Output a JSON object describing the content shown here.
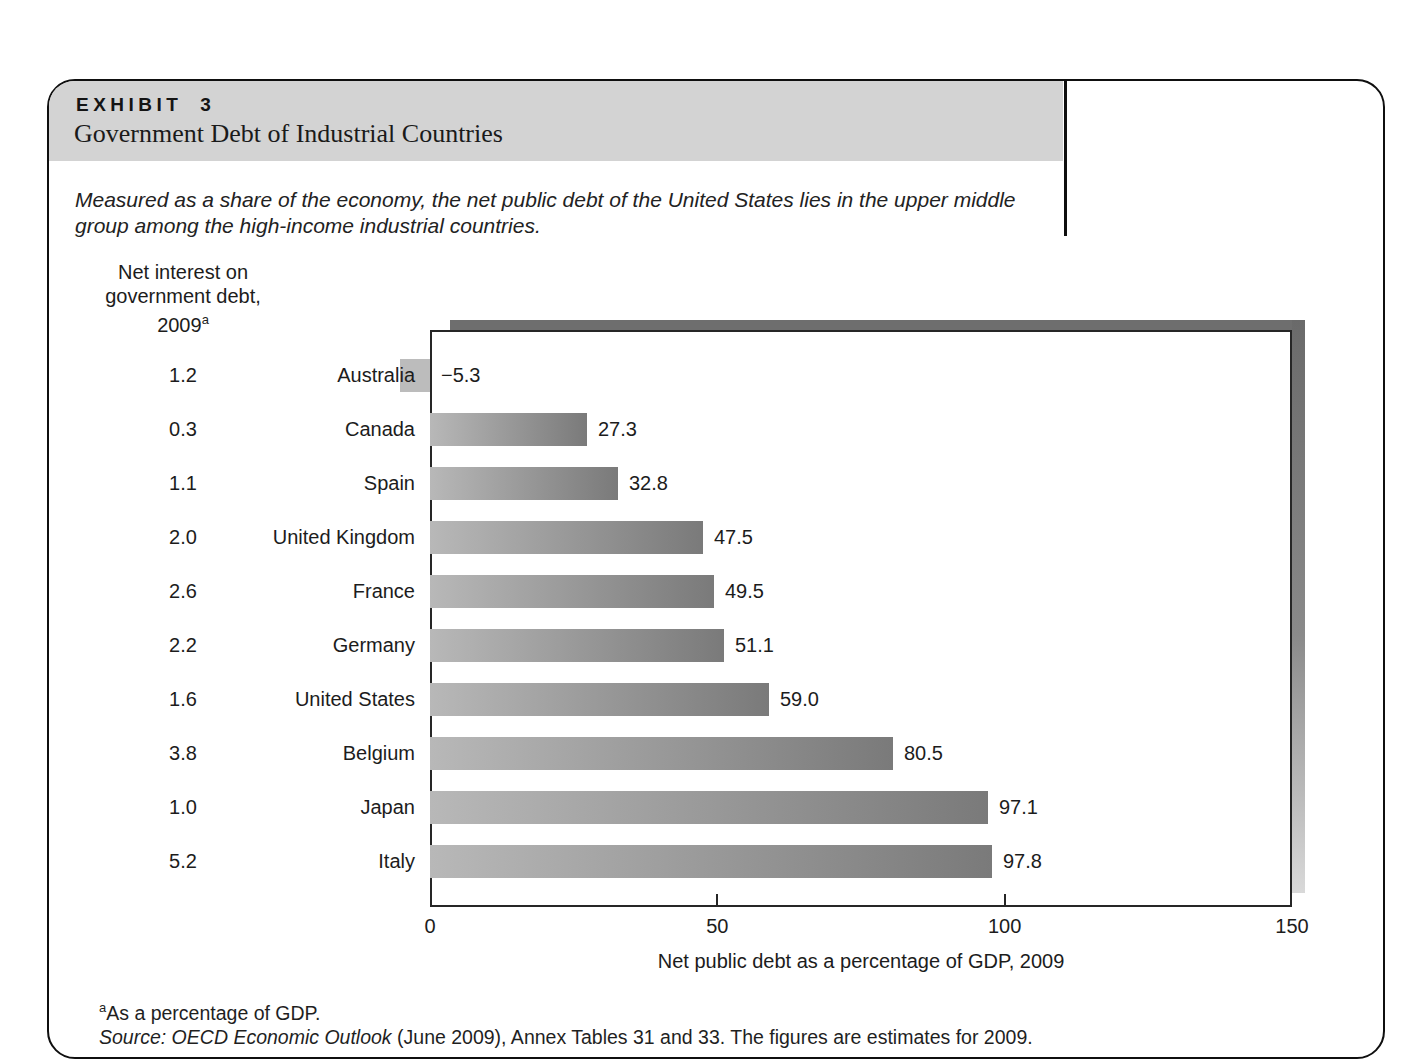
{
  "exhibit": {
    "label": "EXHIBIT 3",
    "title": "Government Debt of Industrial Countries",
    "description_line1": "Measured as a share of the economy, the net public debt of the United States lies in the upper middle",
    "description_line2": "group among the high-income industrial countries.",
    "left_column_header_line1": "Net interest on",
    "left_column_header_line2": "government debt,",
    "left_column_header_line3": "2009",
    "left_column_header_superscript": "a",
    "footnote_superscript": "a",
    "footnote_text": "As a percentage of GDP.",
    "source_italic": "Source: OECD Economic Outlook",
    "source_rest": " (June 2009), Annex Tables 31 and 33. The figures are estimates for 2009."
  },
  "chart_data": {
    "type": "bar",
    "orientation": "horizontal",
    "title": "Government Debt of Industrial Countries",
    "categories": [
      "Australia",
      "Canada",
      "Spain",
      "United Kingdom",
      "France",
      "Germany",
      "United States",
      "Belgium",
      "Japan",
      "Italy"
    ],
    "series": [
      {
        "name": "Net interest on government debt, 2009 (% of GDP)",
        "values": [
          1.2,
          0.3,
          1.1,
          2.0,
          2.6,
          2.2,
          1.6,
          3.8,
          1.0,
          5.2
        ],
        "labels": [
          "1.2",
          "0.3",
          "1.1",
          "2.0",
          "2.6",
          "2.2",
          "1.6",
          "3.8",
          "1.0",
          "5.2"
        ]
      },
      {
        "name": "Net public debt as a percentage of GDP, 2009",
        "values": [
          -5.3,
          27.3,
          32.8,
          47.5,
          49.5,
          51.1,
          59.0,
          80.5,
          97.1,
          97.8
        ],
        "labels": [
          "−5.3",
          "27.3",
          "32.8",
          "47.5",
          "49.5",
          "51.1",
          "59.0",
          "80.5",
          "97.1",
          "97.8"
        ]
      }
    ],
    "xlabel": "Net public debt as a percentage of GDP, 2009",
    "xlim": [
      0,
      150
    ],
    "xticks": [
      0,
      50,
      100,
      150
    ],
    "xtick_labels": [
      "0",
      "50",
      "100",
      "150"
    ],
    "grid": false,
    "legend": "none"
  },
  "colors": {
    "header_band": "#d3d3d3",
    "bar_gradient_start": "#b8b8b8",
    "bar_gradient_end": "#7a7a7a",
    "negative_bar": "#bcbcbc",
    "shadow_dark": "#6e6e6e",
    "shadow_light": "#d9d9d9",
    "plot_border": "#262626",
    "box_border": "#0f0f0f",
    "text": "#1c1c1c"
  }
}
